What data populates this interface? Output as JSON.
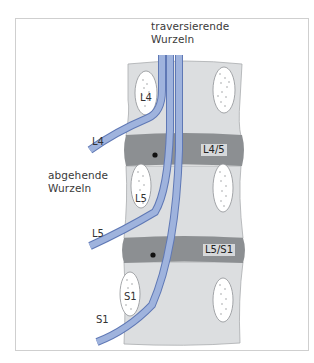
{
  "figure": {
    "title_top": {
      "line1": "traversierende",
      "line2": "Wurzeln"
    },
    "side_label": {
      "line1": "abgehende",
      "line2": "Wurzeln"
    },
    "exiting_roots": [
      "L4",
      "L5",
      "S1"
    ],
    "vertebra_labels": [
      "L4",
      "L5",
      "S1"
    ],
    "disc_labels": [
      "L4/5",
      "L5/S1"
    ],
    "colors": {
      "frame": "#c8c8c8",
      "vertebra": "#dcdee0",
      "vertebra_outline": "#a9acaf",
      "disc": "#8c8f92",
      "root_fill": "#9fb3dd",
      "root_edge": "#5f78b5",
      "pedicle": "#ffffff",
      "marker": "#111111"
    }
  }
}
